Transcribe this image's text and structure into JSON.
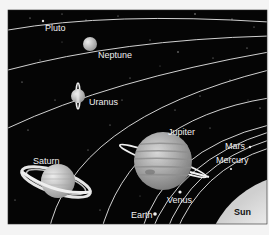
{
  "diagram": {
    "type": "solar-system-illustration",
    "colors": {
      "page_background": "#f4f4f4",
      "space": "#050505",
      "orbit": "#e8e8e8",
      "planet_light": "#d6d6d6",
      "sun": "#f8f8f8",
      "sun_label": "#111111"
    },
    "bodies": [
      {
        "id": "pluto",
        "label": "Pluto"
      },
      {
        "id": "neptune",
        "label": "Neptune"
      },
      {
        "id": "uranus",
        "label": "Uranus"
      },
      {
        "id": "saturn",
        "label": "Saturn"
      },
      {
        "id": "jupiter",
        "label": "Jupiter"
      },
      {
        "id": "mars",
        "label": "Mars"
      },
      {
        "id": "mercury",
        "label": "Mercury"
      },
      {
        "id": "venus",
        "label": "Venus"
      },
      {
        "id": "earth",
        "label": "Earth"
      },
      {
        "id": "sun",
        "label": "Sun"
      }
    ]
  }
}
